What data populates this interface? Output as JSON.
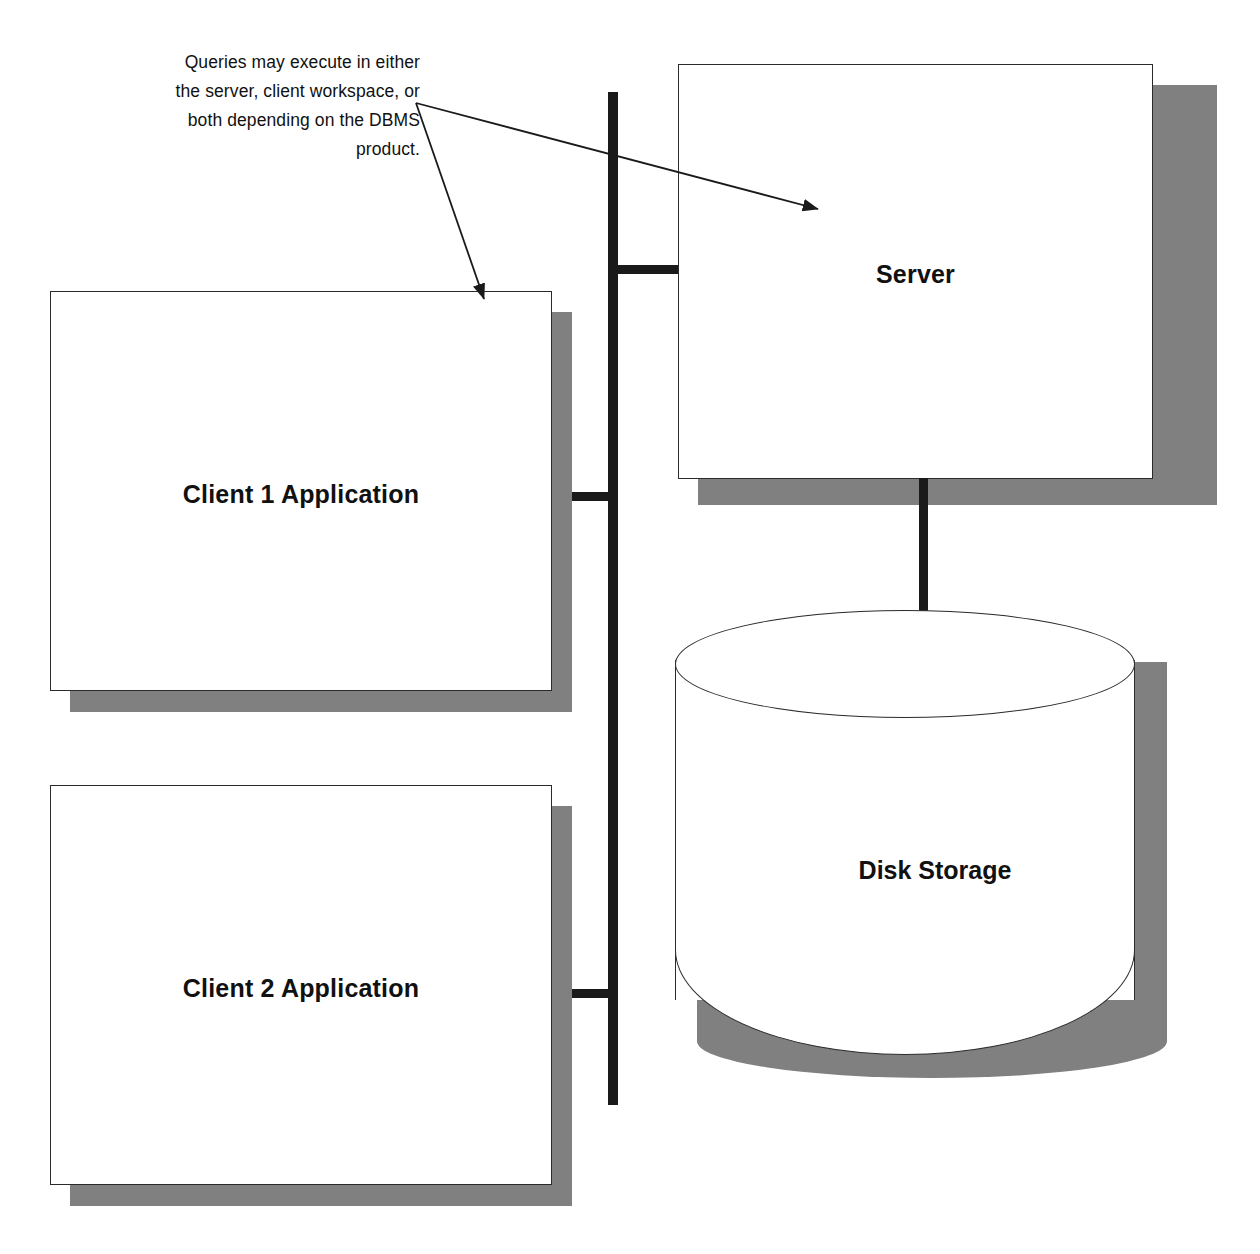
{
  "diagram": {
    "annotation": {
      "lines": [
        "Queries may execute in either",
        "the server, client workspace, or",
        "both depending on the DBMS",
        "product."
      ],
      "full_text": "Queries may execute in either the server, client workspace, or both depending on the DBMS product."
    },
    "nodes": {
      "client1": {
        "label": "Client 1 Application",
        "shape": "rectangle"
      },
      "client2": {
        "label": "Client 2 Application",
        "shape": "rectangle"
      },
      "server": {
        "label": "Server",
        "shape": "rectangle"
      },
      "disk": {
        "label": "Disk Storage",
        "shape": "cylinder"
      }
    },
    "connections": [
      {
        "from": "client1",
        "to": "bus",
        "style": "solid-thick"
      },
      {
        "from": "client2",
        "to": "bus",
        "style": "solid-thick"
      },
      {
        "from": "server",
        "to": "bus",
        "style": "solid-thick"
      },
      {
        "from": "server",
        "to": "disk",
        "style": "solid-thick"
      }
    ],
    "arrows": [
      {
        "from": "annotation",
        "to": "client1",
        "head": "filled-triangle"
      },
      {
        "from": "annotation",
        "to": "server",
        "head": "filled-triangle"
      }
    ],
    "colors": {
      "line": "#1a1a1a",
      "box_border": "#2b2b2b",
      "shadow": "#808080",
      "background": "#ffffff",
      "text": "#111111"
    }
  }
}
